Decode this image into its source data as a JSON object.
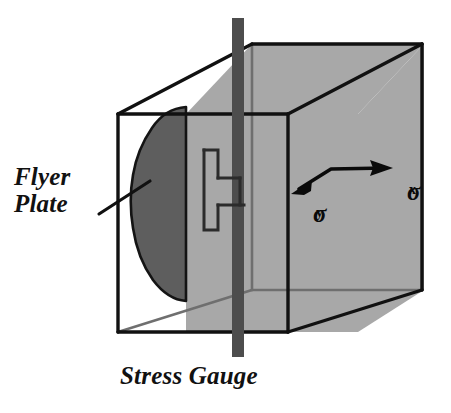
{
  "figure": {
    "background_color": "#ffffff",
    "width": 451,
    "height": 413
  },
  "labels": {
    "flyer_plate": "Flyer\nPlate",
    "stress_gauge": "Stress Gauge",
    "sigma_x_glyph": "σ",
    "sigma_x_sub": "x",
    "sigma_y_glyph": "σ",
    "sigma_y_sub": "y"
  },
  "colors": {
    "outline": "#111111",
    "hidden_edge": "#6f6f6f",
    "gauge_plane_fill": "#a8a8a8",
    "flyer_plate_fill": "#5e5e5e",
    "rod_fill": "#4d4d4d",
    "gauge_outline": "#2b2b2b",
    "arrow": "#0a0a0a",
    "text": "#111111"
  },
  "geometry": {
    "cube": {
      "front_face": {
        "left": 118,
        "top": 114,
        "right": 288,
        "bottom": 332
      },
      "back_face": {
        "left": 252,
        "top": 42,
        "right": 422,
        "bottom": 290
      },
      "projection": "oblique, back face offset up and to the right"
    },
    "gauge_plane": {
      "left": 186,
      "right": 358,
      "description": "vertical gray slab spanning cube height"
    },
    "rod": {
      "x": 238,
      "top": 18,
      "bottom": 357,
      "width": 12
    },
    "gauge_element": {
      "left": 200,
      "top": 145,
      "right": 236,
      "bottom": 232,
      "shape": "H-outline"
    },
    "flyer_plate_blob": {
      "center_x": 173,
      "center_y": 207,
      "rx": 42,
      "ry": 100
    }
  },
  "annotations": {
    "leader_line": {
      "from_x": 100,
      "from_y": 213,
      "to_x": 148,
      "to_y": 182
    },
    "stress_arrow": {
      "bend_x": 330,
      "bend_y": 169,
      "left_tip_x": 293,
      "left_tip_y": 192,
      "right_tip_x": 392,
      "right_tip_y": 168,
      "description": "double-headed bent arrow; sigma-y points down-left, sigma-x points right"
    }
  }
}
